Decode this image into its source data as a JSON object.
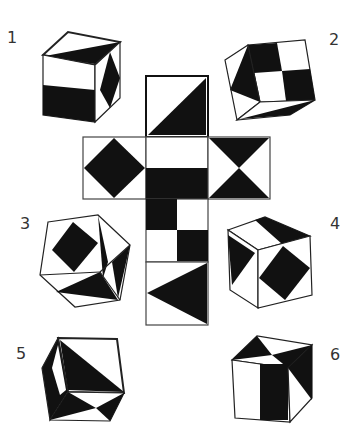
{
  "labels": {
    "cube1": "1",
    "cube2": "2",
    "cube3": "3",
    "cube4": "4",
    "cube5": "5",
    "cube6": "6"
  },
  "net": {
    "faces": [
      {
        "id": "top",
        "pattern": "diagonal half, black lower-right triangle"
      },
      {
        "id": "left",
        "pattern": "black diamond"
      },
      {
        "id": "center",
        "pattern": "horizontal split, black lower half"
      },
      {
        "id": "right",
        "pattern": "hourglass / bowtie triangles top and bottom"
      },
      {
        "id": "below-center",
        "pattern": "2x2 checkerboard, black top-left and bottom-right"
      },
      {
        "id": "bottom",
        "pattern": "black triangle pointing left"
      }
    ]
  },
  "colors": {
    "ink": "#111111",
    "paper": "#ffffff",
    "edge": "#444444"
  }
}
